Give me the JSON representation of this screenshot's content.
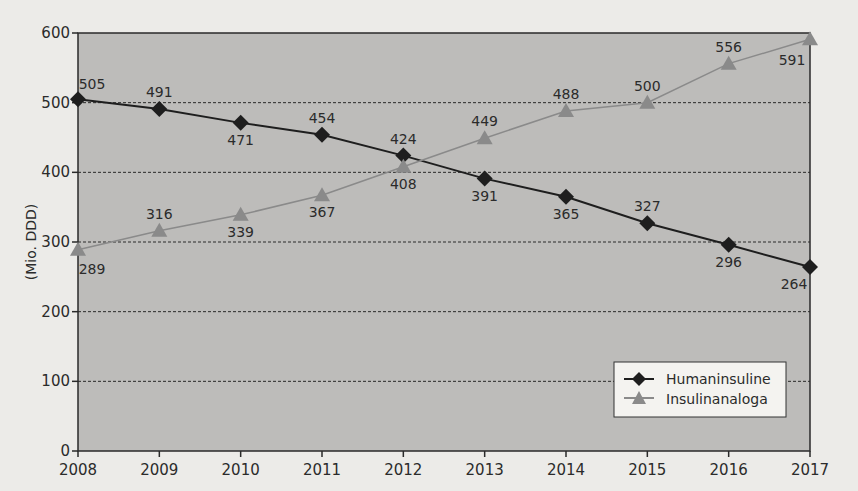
{
  "chart_data": {
    "type": "line",
    "title": "",
    "xlabel": "",
    "ylabel": "(Mio. DDD)",
    "x": [
      "2008",
      "2009",
      "2010",
      "2011",
      "2012",
      "2013",
      "2014",
      "2015",
      "2016",
      "2017"
    ],
    "series": [
      {
        "name": "Humaninsuline",
        "marker": "diamond",
        "color": "#1e1e1e",
        "values": [
          505,
          491,
          471,
          454,
          424,
          391,
          365,
          327,
          296,
          264
        ]
      },
      {
        "name": "Insulinanaloga",
        "marker": "triangle",
        "color": "#8a8a8a",
        "values": [
          289,
          316,
          339,
          367,
          408,
          449,
          488,
          500,
          556,
          591
        ]
      }
    ],
    "ylim": [
      0,
      600
    ],
    "yticks": [
      0,
      100,
      200,
      300,
      400,
      500,
      600
    ],
    "grid": "horizontal dashed",
    "legend_position": "lower right inside plot",
    "plot_background": "#bdbcba"
  }
}
